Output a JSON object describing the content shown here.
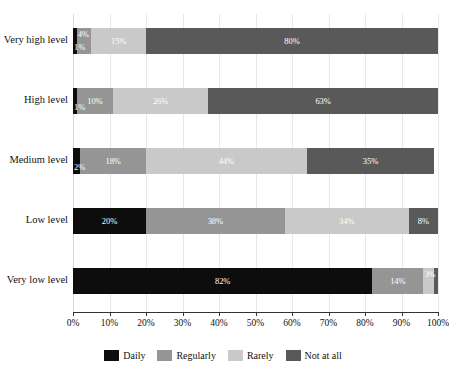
{
  "chart_data": {
    "type": "bar",
    "orientation": "horizontal",
    "stacked": true,
    "normalized": true,
    "title": "",
    "subtitle": "",
    "xlabel": "",
    "ylabel": "",
    "xlim": [
      0,
      100
    ],
    "grid": true,
    "legend_position": "bottom",
    "xticks": [
      0,
      10,
      20,
      30,
      40,
      50,
      60,
      70,
      80,
      90,
      100
    ],
    "xtick_labels": [
      "0%",
      "10%",
      "20%",
      "30%",
      "40%",
      "50%",
      "60%",
      "70%",
      "80%",
      "90%",
      "100%"
    ],
    "categories": [
      "Very high level",
      "High level",
      "Medium level",
      "Low level",
      "Very low level"
    ],
    "series": [
      {
        "name": "Daily",
        "color": "#0d0d0d",
        "values": [
          1,
          1,
          2,
          20,
          82
        ],
        "labels": [
          "1%",
          "1%",
          "2%",
          "20%",
          "82%"
        ]
      },
      {
        "name": "Regularly",
        "color": "#959595",
        "values": [
          4,
          10,
          18,
          38,
          14
        ],
        "labels": [
          "4%",
          "10%",
          "18%",
          "38%",
          "14%"
        ]
      },
      {
        "name": "Rarely",
        "color": "#c9c9c9",
        "values": [
          15,
          26,
          44,
          34,
          3
        ],
        "labels": [
          "15%",
          "26%",
          "44%",
          "34%",
          "3%"
        ]
      },
      {
        "name": "Not at all",
        "color": "#595959",
        "values": [
          80,
          63,
          35,
          8,
          1
        ],
        "labels": [
          "80%",
          "63%",
          "35%",
          "8%",
          ""
        ]
      }
    ]
  },
  "legend": {
    "items": [
      {
        "label": "Daily",
        "color": "#0d0d0d"
      },
      {
        "label": "Regularly",
        "color": "#959595"
      },
      {
        "label": "Rarely",
        "color": "#c9c9c9"
      },
      {
        "label": "Not at all",
        "color": "#595959"
      }
    ]
  }
}
